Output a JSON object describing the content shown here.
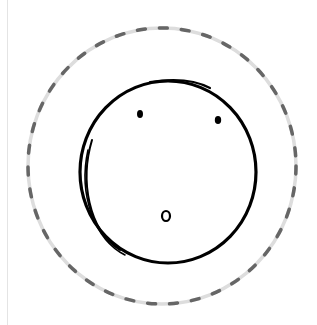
{
  "canvas": {
    "width": 317,
    "height": 325,
    "background": "#ffffff",
    "edge_line_color": "#e4e4e4"
  },
  "drawing": {
    "subject": "surprised face sketch",
    "outer_ring": {
      "style": "dashed",
      "dash_color": "#666666",
      "gap_color": "#dddddd",
      "cx": 162,
      "cy": 166,
      "rx": 134,
      "ry": 138
    },
    "face": {
      "stroke": "#000000",
      "cx": 168,
      "cy": 172,
      "rx": 88,
      "ry": 91
    },
    "eyes": [
      {
        "cx": 140,
        "cy": 114
      },
      {
        "cx": 218,
        "cy": 120
      }
    ],
    "mouth": {
      "shape": "small-o",
      "cx": 166,
      "cy": 216
    }
  }
}
